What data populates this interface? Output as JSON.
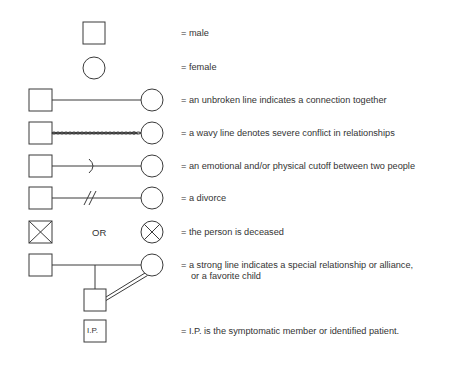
{
  "legend": {
    "items": [
      {
        "symbol": "male-square",
        "text": "= male"
      },
      {
        "symbol": "female-circle",
        "text": "= female"
      },
      {
        "symbol": "unbroken-line",
        "text": "= an unbroken line indicates a connection together"
      },
      {
        "symbol": "wavy-line",
        "text": "= a wavy line denotes severe conflict in relationships"
      },
      {
        "symbol": "cutoff-line",
        "text": "= an emotional and/or physical cutoff between two people"
      },
      {
        "symbol": "divorce-line",
        "text": "= a divorce"
      },
      {
        "symbol": "deceased",
        "text": "= the person is deceased",
        "separator": "OR"
      },
      {
        "symbol": "strong-line",
        "text": "= a strong line indicates a special relationship or alliance,",
        "text_cont": "or a favorite child"
      },
      {
        "symbol": "identified-patient",
        "text": "= I.P. is the symptomatic member or identified patient.",
        "box_label": "I.P."
      }
    ]
  },
  "colors": {
    "stroke": "#3a3a3a",
    "background": "#ffffff"
  }
}
